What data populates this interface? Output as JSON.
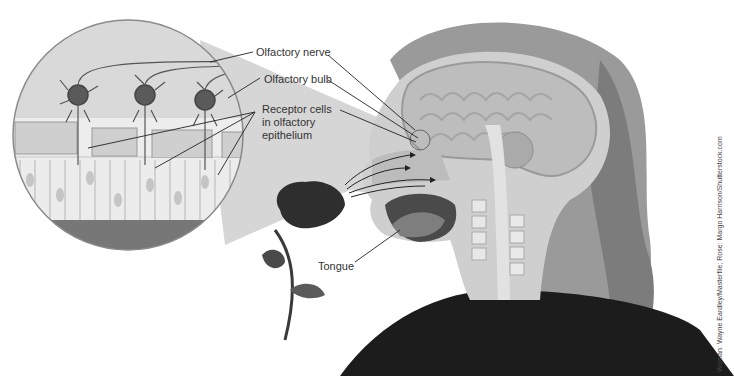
{
  "figure": {
    "labels": {
      "olfactory_nerve": "Olfactory nerve",
      "olfactory_bulb": "Olfactory bulb",
      "receptor_cells_line1": "Receptor cells",
      "receptor_cells_line2": "in olfactory",
      "receptor_cells_line3": "epithelium",
      "tongue": "Tongue"
    },
    "credit": "Woman: Wayne Eardley/Masterfile; Rose: Margo Harrison/Shutterstock.com",
    "colors": {
      "background": "#ffffff",
      "magnifier_cone": "#d9d9d9",
      "hair": "#8a8a8a",
      "shirt": "#1a1a1a",
      "brain": "#c8c8c8",
      "rose": "#2a2a2a",
      "leader_line": "#222222"
    }
  }
}
